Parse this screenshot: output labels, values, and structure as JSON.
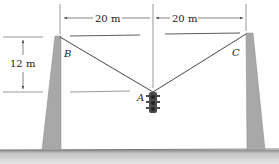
{
  "diagram": {
    "type": "statics-cable-traffic-light",
    "labels": {
      "point_a": "A",
      "point_b": "B",
      "point_c": "C"
    },
    "dimensions": {
      "left_span": "20 m",
      "right_span": "20 m",
      "sag": "12 m"
    },
    "colors": {
      "pole": "#a8a8a8",
      "ground": "#b5b5b5",
      "line": "#333333",
      "light_body": "#4a4a4a"
    }
  }
}
